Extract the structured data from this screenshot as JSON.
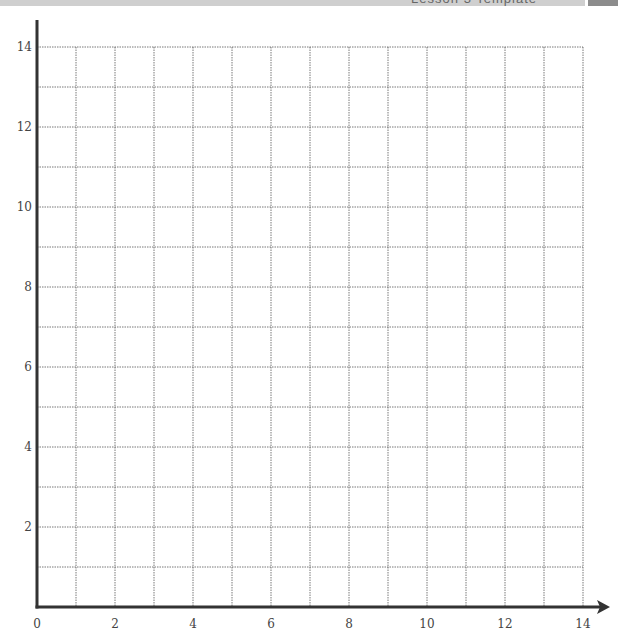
{
  "header": {
    "title": "Lesson 3 Template",
    "tab_label": ""
  },
  "chart_data": {
    "type": "scatter",
    "title": "",
    "xlabel": "",
    "ylabel": "",
    "xlim": [
      0,
      14
    ],
    "ylim": [
      0,
      14
    ],
    "grid": true,
    "grid_step": 1,
    "x_tick_labels": [
      "0",
      "2",
      "4",
      "6",
      "8",
      "10",
      "12",
      "14"
    ],
    "y_tick_labels": [
      "2",
      "4",
      "6",
      "8",
      "10",
      "12",
      "14"
    ],
    "series": []
  }
}
